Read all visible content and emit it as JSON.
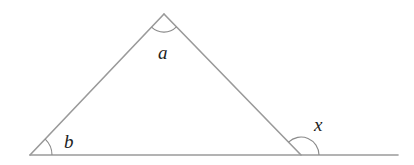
{
  "diagram": {
    "type": "triangle-exterior-angle",
    "line_color": "#9a9a9a",
    "label_color": "#222222",
    "vertices": {
      "apex": {
        "x": 164,
        "y": 14
      },
      "bottom_left": {
        "x": 30,
        "y": 155
      },
      "bottom_right": {
        "x": 301,
        "y": 155
      }
    },
    "baseline_end": {
      "x": 398,
      "y": 155
    },
    "labels": {
      "apex_angle": "a",
      "left_angle": "b",
      "exterior_angle": "x"
    }
  }
}
